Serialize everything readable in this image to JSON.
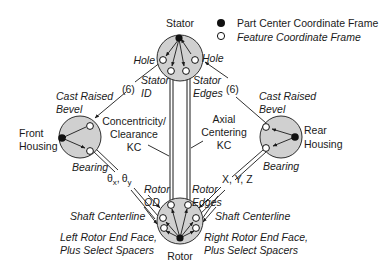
{
  "legend": {
    "items": [
      {
        "symbol": "filled-circle",
        "label": "Part Center Coordinate Frame"
      },
      {
        "symbol": "open-circle",
        "label": "Feature Coordinate Frame"
      }
    ]
  },
  "nodes": {
    "stator": {
      "label": "Stator"
    },
    "front_housing": {
      "label_line1": "Front",
      "label_line2": "Housing"
    },
    "rear_housing": {
      "label_line1": "Rear",
      "label_line2": "Housing"
    },
    "rotor": {
      "label": "Rotor"
    }
  },
  "features": {
    "stator_hole_left": "Hole",
    "stator_hole_right": "Hole",
    "stator_id_line1": "Stator",
    "stator_id_line2": "ID",
    "stator_edges_line1": "Stator",
    "stator_edges_line2": "Edges",
    "front_bevel_line1": "Cast Raised",
    "front_bevel_line2": "Bevel",
    "rear_bevel_line1": "Cast Raised",
    "rear_bevel_line2": "Bevel",
    "front_bearing": "Bearing",
    "rear_bearing": "Bearing",
    "rotor_od_line1": "Rotor",
    "rotor_od_line2": "OD",
    "rotor_edges_line1": "Rotor",
    "rotor_edges_line2": "Edges",
    "left_shaft": "Shaft Centerline",
    "right_shaft": "Shaft Centerline",
    "left_end_face_line1": "Left Rotor End  Face,",
    "left_end_face_line2": "Plus Select Spacers",
    "right_end_face_line1": "Right Rotor End Face,",
    "right_end_face_line2": "Plus Select Spacers"
  },
  "connections": {
    "left_count": "(6)",
    "right_count": "(6)",
    "left_dof_theta": "θ",
    "left_dof_sub_x": "x",
    "left_dof_sep": ",",
    "left_dof_sub_y": "y",
    "right_dof": "X, Y, Z"
  },
  "key_characteristics": {
    "concentricity_line1": "Concentricity/",
    "concentricity_line2": "Clearance",
    "concentricity_line3": "KC",
    "axial_line1": "Axial",
    "axial_line2": "Centering",
    "axial_line3": "KC"
  },
  "colors": {
    "part_fill": "#d0d0d0",
    "stroke": "#1a1a1a",
    "feature_fill": "#ffffff"
  }
}
